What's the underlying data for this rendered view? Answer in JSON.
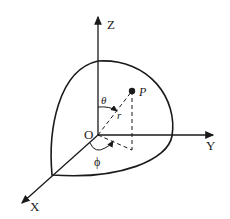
{
  "diagram": {
    "axes": {
      "x": "X",
      "y": "Y",
      "z": "Z"
    },
    "origin": "O",
    "point": "P",
    "radius": "r",
    "polar_angle": "θ",
    "azimuth_angle": "ϕ",
    "colors": {
      "stroke": "#1a1a1a",
      "background": "#ffffff"
    }
  }
}
